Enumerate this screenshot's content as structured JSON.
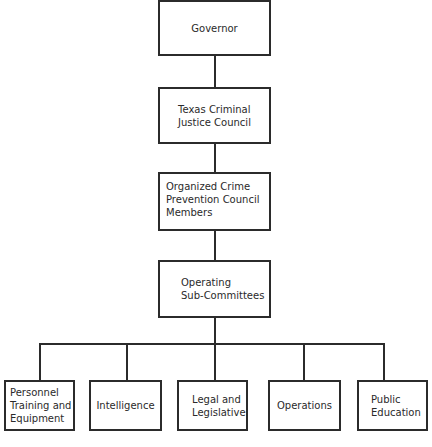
{
  "chart": {
    "type": "org-chart",
    "levels": [
      {
        "label": "Governor"
      },
      {
        "label": "Texas Criminal\nJustice Council"
      },
      {
        "label": "Organized Crime\nPrevention Council\nMembers"
      },
      {
        "label": "Operating\nSub-Committees"
      }
    ],
    "sub_committees": [
      {
        "label": "Personnel\nTraining and\nEquipment"
      },
      {
        "label": "Intelligence"
      },
      {
        "label": "Legal and\nLegislative"
      },
      {
        "label": "Operations"
      },
      {
        "label": "Public\nEducation"
      }
    ]
  }
}
